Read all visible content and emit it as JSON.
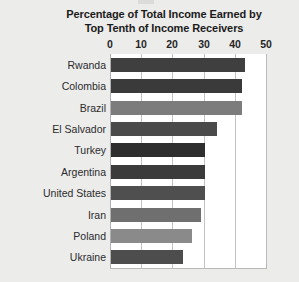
{
  "chart_data": {
    "type": "bar",
    "orientation": "horizontal",
    "title": "Percentage of Total Income Earned by Top Tenth of Income Receivers",
    "title_lines": [
      "Percentage of Total Income Earned by",
      "Top Tenth of Income Receivers"
    ],
    "xlabel": "",
    "ylabel": "",
    "xlim": [
      0,
      50
    ],
    "xticks": [
      0,
      10,
      20,
      30,
      40,
      50
    ],
    "xtick_labels": [
      "0",
      "10",
      "20",
      "30",
      "40",
      "50"
    ],
    "grid": "vertical",
    "legend": "none",
    "categories": [
      "Rwanda",
      "Colombia",
      "Brazil",
      "El Salvador",
      "Turkey",
      "Argentina",
      "United States",
      "Iran",
      "Poland",
      "Ukraine"
    ],
    "values": [
      43,
      42,
      42,
      34,
      30,
      30,
      30,
      29,
      26,
      23
    ],
    "bar_colors": [
      "#3f3f3f",
      "#3a3a3a",
      "#7c7c7c",
      "#4a4a4a",
      "#2e2e2e",
      "#3b3b3b",
      "#4f4f4f",
      "#6f6f6f",
      "#8a8a8a",
      "#4d4d4d"
    ],
    "plot_background": "#ffffff",
    "figure_background": "#ececeb",
    "gridline_color": "#c2c2c1",
    "text_color": "#1b1b1b"
  }
}
